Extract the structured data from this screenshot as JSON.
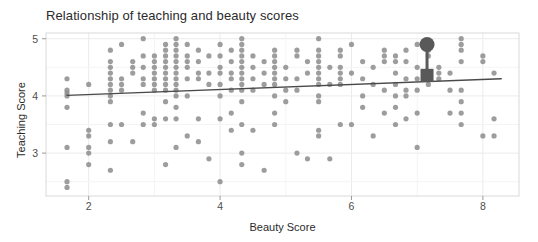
{
  "chart_data": {
    "type": "scatter",
    "title": "Relationship of teaching and beauty scores",
    "xlabel": "Beauty Score",
    "ylabel": "Teaching Score",
    "xlim": [
      1.35,
      8.55
    ],
    "ylim": [
      2.25,
      5.1
    ],
    "xticks": [
      2,
      4,
      6,
      8
    ],
    "xtick_labels": [
      "2",
      "4",
      "6",
      "8"
    ],
    "yticks": [
      3,
      4,
      5
    ],
    "ytick_labels": [
      "3",
      "4",
      "5"
    ],
    "grid": true,
    "grid_color": "#ebebeb",
    "panel_background": "#ffffff",
    "panel_border_color": "#d9d9d9",
    "point_color": "#8c8c8c",
    "point_opacity": 0.85,
    "point_radius": 2.6,
    "legend": "none",
    "trendline": {
      "type": "linear",
      "color": "#4a4a4a",
      "width": 1.3,
      "x_start": 1.67,
      "y_start": 4.01,
      "x_end": 8.28,
      "y_end": 4.3,
      "slope": 0.0437,
      "intercept": 3.937
    },
    "cursor_overlay": {
      "visible": true,
      "color": "#595959",
      "circle_x": 7.15,
      "circle_y": 4.9,
      "circle_radius": 7.5,
      "square_x": 7.15,
      "square_y": 4.36,
      "square_size": 13
    },
    "x": [
      1.67,
      1.67,
      1.67,
      1.67,
      1.67,
      1.67,
      1.67,
      1.67,
      2.0,
      2.0,
      2.0,
      2.0,
      2.0,
      2.0,
      2.33,
      2.33,
      2.33,
      2.33,
      2.33,
      2.33,
      2.33,
      2.33,
      2.33,
      2.33,
      2.33,
      2.33,
      2.5,
      2.5,
      2.5,
      2.5,
      2.5,
      2.67,
      2.67,
      2.67,
      2.67,
      2.83,
      2.83,
      2.83,
      2.83,
      2.83,
      2.83,
      2.83,
      3.0,
      3.0,
      3.0,
      3.0,
      3.0,
      3.0,
      3.0,
      3.0,
      3.0,
      3.17,
      3.17,
      3.17,
      3.17,
      3.17,
      3.17,
      3.17,
      3.17,
      3.17,
      3.17,
      3.17,
      3.17,
      3.33,
      3.33,
      3.33,
      3.33,
      3.33,
      3.33,
      3.33,
      3.33,
      3.33,
      3.33,
      3.33,
      3.33,
      3.33,
      3.33,
      3.5,
      3.5,
      3.5,
      3.5,
      3.5,
      3.5,
      3.5,
      3.67,
      3.67,
      3.67,
      3.67,
      3.67,
      3.67,
      3.83,
      3.83,
      3.83,
      3.83,
      4.0,
      4.0,
      4.0,
      4.0,
      4.0,
      4.0,
      4.0,
      4.0,
      4.17,
      4.17,
      4.17,
      4.17,
      4.17,
      4.17,
      4.17,
      4.33,
      4.33,
      4.33,
      4.33,
      4.33,
      4.33,
      4.33,
      4.33,
      4.33,
      4.33,
      4.33,
      4.33,
      4.33,
      4.33,
      4.5,
      4.5,
      4.5,
      4.5,
      4.5,
      4.67,
      4.67,
      4.67,
      4.67,
      4.83,
      4.83,
      4.83,
      4.83,
      4.83,
      4.83,
      4.83,
      4.83,
      4.83,
      4.83,
      5.0,
      5.0,
      5.0,
      5.0,
      5.17,
      5.17,
      5.17,
      5.17,
      5.17,
      5.33,
      5.33,
      5.33,
      5.5,
      5.5,
      5.5,
      5.5,
      5.5,
      5.5,
      5.5,
      5.5,
      5.5,
      5.5,
      5.5,
      5.5,
      5.67,
      5.67,
      5.67,
      5.83,
      5.83,
      5.83,
      5.83,
      5.83,
      5.83,
      5.83,
      6.0,
      6.0,
      6.0,
      6.17,
      6.17,
      6.17,
      6.17,
      6.33,
      6.33,
      6.33,
      6.5,
      6.5,
      6.5,
      6.5,
      6.5,
      6.67,
      6.67,
      6.67,
      6.67,
      6.67,
      6.67,
      6.67,
      6.83,
      6.83,
      6.83,
      6.83,
      6.83,
      6.83,
      7.0,
      7.0,
      7.0,
      7.0,
      7.0,
      7.0,
      7.17,
      7.17,
      7.17,
      7.17,
      7.17,
      7.33,
      7.33,
      7.33,
      7.5,
      7.5,
      7.5,
      7.67,
      7.67,
      7.67,
      7.67,
      7.67,
      7.67,
      7.67,
      7.67,
      8.0,
      8.0,
      8.0,
      8.17,
      8.17,
      8.17
    ],
    "y": [
      4.3,
      4.1,
      4.0,
      3.8,
      3.1,
      2.5,
      2.4,
      4.05,
      4.2,
      3.4,
      3.3,
      3.1,
      3.0,
      2.8,
      4.8,
      4.6,
      4.5,
      4.4,
      4.3,
      4.2,
      4.1,
      4.0,
      3.9,
      3.5,
      3.2,
      2.7,
      4.9,
      4.3,
      4.2,
      4.1,
      3.5,
      4.6,
      4.5,
      4.4,
      3.2,
      5.0,
      4.7,
      4.5,
      4.3,
      4.2,
      3.7,
      3.5,
      4.7,
      4.6,
      4.5,
      4.4,
      4.3,
      4.2,
      4.1,
      3.6,
      3.5,
      4.9,
      4.8,
      4.7,
      4.6,
      4.5,
      4.4,
      4.3,
      4.2,
      4.1,
      3.9,
      3.6,
      2.8,
      5.0,
      4.9,
      4.8,
      4.7,
      4.6,
      4.5,
      4.4,
      4.3,
      4.2,
      4.1,
      4.0,
      3.8,
      3.6,
      3.1,
      4.9,
      4.7,
      4.6,
      4.5,
      4.3,
      4.0,
      3.3,
      4.8,
      4.6,
      4.4,
      4.3,
      3.6,
      3.2,
      4.7,
      4.4,
      4.2,
      2.9,
      4.9,
      4.7,
      4.5,
      4.4,
      4.2,
      4.0,
      3.6,
      2.5,
      4.8,
      4.6,
      4.4,
      4.3,
      4.1,
      3.7,
      3.4,
      5.0,
      4.9,
      4.8,
      4.7,
      4.6,
      4.5,
      4.4,
      4.3,
      4.2,
      4.1,
      3.9,
      3.5,
      3.0,
      2.8,
      4.7,
      4.5,
      4.3,
      4.1,
      3.4,
      4.6,
      4.4,
      4.2,
      2.7,
      4.8,
      4.7,
      4.6,
      4.5,
      4.4,
      4.3,
      4.2,
      4.0,
      3.7,
      3.5,
      4.5,
      4.3,
      4.1,
      3.9,
      4.8,
      4.7,
      4.3,
      4.1,
      3.0,
      4.6,
      4.4,
      2.9,
      5.0,
      4.8,
      4.7,
      4.6,
      4.5,
      4.4,
      4.3,
      4.2,
      4.0,
      3.9,
      3.4,
      3.3,
      4.5,
      4.2,
      2.9,
      4.8,
      4.7,
      4.5,
      4.4,
      4.3,
      4.2,
      3.5,
      4.9,
      4.4,
      3.5,
      4.6,
      4.3,
      4.0,
      3.8,
      4.5,
      4.2,
      3.3,
      4.8,
      4.7,
      4.6,
      4.1,
      3.7,
      4.7,
      4.6,
      4.4,
      4.2,
      4.0,
      3.8,
      3.5,
      4.8,
      4.6,
      4.3,
      4.1,
      4.0,
      3.6,
      4.9,
      4.5,
      4.3,
      4.1,
      3.7,
      3.1,
      4.9,
      4.8,
      4.7,
      4.4,
      4.2,
      4.5,
      4.4,
      4.3,
      4.4,
      4.1,
      3.7,
      5.0,
      4.9,
      4.8,
      4.6,
      4.1,
      3.9,
      3.7,
      3.5,
      4.7,
      4.6,
      3.3,
      4.4,
      3.6,
      3.3
    ]
  }
}
